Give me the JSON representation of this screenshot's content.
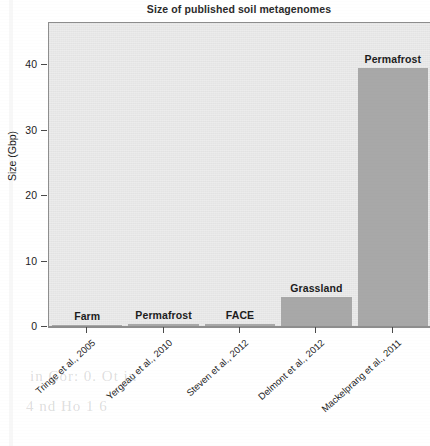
{
  "chart_data": {
    "type": "bar",
    "title": "Size of published soil metagenomes",
    "xlabel": "",
    "ylabel": "Size (Gbp)",
    "ylim": [
      0,
      44
    ],
    "yticks": [
      0,
      10,
      20,
      30,
      40
    ],
    "ytick_labels": [
      "0",
      "10",
      "20",
      "30",
      "40"
    ],
    "grid": false,
    "legend": "none",
    "categories": [
      "Tringe et al., 2005",
      "Yergeau et al., 2010",
      "Steven et al., 2012",
      "Delmont et al., 2012",
      "Mackelprang et al., 2011"
    ],
    "values": [
      0.1,
      0.4,
      0.4,
      4.6,
      39.6
    ],
    "bar_labels": [
      "Farm",
      "Permafrost",
      "FACE",
      "Grassland",
      "Permafrost"
    ],
    "bar_color": "#a8a8a8",
    "panel_background": "#ececec",
    "axis_color": "#4a4a4a"
  },
  "figure": {
    "title": "Size of published soil metagenomes",
    "yaxis_title": "Size (Gbp)"
  },
  "yticks": [
    {
      "label": "40",
      "value": 40
    },
    {
      "label": "30",
      "value": 30
    },
    {
      "label": "20",
      "value": 20
    },
    {
      "label": "10",
      "value": 10
    },
    {
      "label": "0",
      "value": 0
    }
  ],
  "bars": [
    {
      "label": "Farm",
      "category": "Tringe et al., 2005",
      "value": 0.1
    },
    {
      "label": "Permafrost",
      "category": "Yergeau et al., 2010",
      "value": 0.4
    },
    {
      "label": "FACE",
      "category": "Steven et al., 2012",
      "value": 0.4
    },
    {
      "label": "Grassland",
      "category": "Delmont et al., 2012",
      "value": 4.6
    },
    {
      "label": "Permafrost",
      "category": "Mackelprang et al., 2011",
      "value": 39.6
    }
  ],
  "ghost": {
    "line1": "in  Cor: 0.  Ot  in",
    "line2": "4  nd   Ho  1  6"
  }
}
